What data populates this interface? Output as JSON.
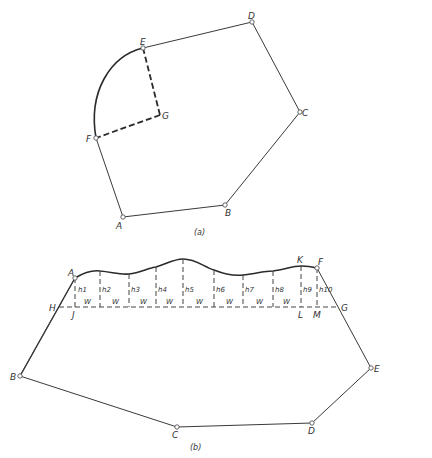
{
  "figure_a": {
    "caption": "(a)",
    "labels": {
      "A": "A",
      "B": "B",
      "C": "C",
      "D": "D",
      "E": "E",
      "F": "F",
      "G": "G"
    },
    "points": {
      "A": [
        123,
        217
      ],
      "B": [
        225,
        205
      ],
      "C": [
        300,
        112
      ],
      "D": [
        252,
        22
      ],
      "E": [
        143,
        48
      ],
      "F": [
        96,
        138
      ],
      "G": [
        160,
        115
      ]
    },
    "description": "Polygon ABCDE with circular arc EF centered at G; radii GE and GF dashed"
  },
  "figure_b": {
    "caption": "(b)",
    "labels": {
      "A": "A",
      "B": "B",
      "C": "C",
      "D": "D",
      "E": "E",
      "F": "F",
      "G": "G",
      "H": "H",
      "J": "J",
      "K": "K",
      "L": "L",
      "M": "M"
    },
    "offset_labels": [
      "h1",
      "h2",
      "h3",
      "h4",
      "h5",
      "h6",
      "h7",
      "h8",
      "h9",
      "h10"
    ],
    "width_label": "W",
    "width_count": 8,
    "points": {
      "A": [
        75,
        278
      ],
      "B": [
        20,
        376
      ],
      "C": [
        177,
        427
      ],
      "D": [
        312,
        423
      ],
      "E": [
        371,
        368
      ],
      "F": [
        317,
        268
      ],
      "G": [
        339,
        307
      ],
      "H": [
        59,
        307
      ]
    },
    "baseline_y": 307,
    "offset_x": [
      75,
      100,
      129,
      156,
      183,
      214,
      243,
      273,
      301,
      317
    ],
    "curve_y": [
      278,
      271,
      274,
      267,
      259,
      270,
      275,
      271,
      266,
      268
    ],
    "description": "Traverse ABCDEF with irregular boundary A-F; offsets h1..h10 measured from baseline HG at equal intervals W"
  }
}
